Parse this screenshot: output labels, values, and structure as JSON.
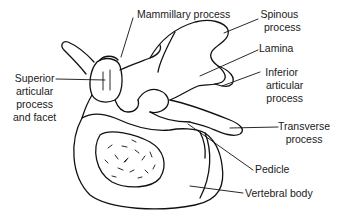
{
  "diagram": {
    "line_color": "#111111",
    "background": "#ffffff",
    "labels": [
      {
        "id": "mammillary",
        "text": "Mammillary process"
      },
      {
        "id": "spinous",
        "line1": "Spinous",
        "line2": "process"
      },
      {
        "id": "lamina",
        "text": "Lamina"
      },
      {
        "id": "inferior",
        "line1": "Inferior",
        "line2": "articular",
        "line3": "process"
      },
      {
        "id": "superior",
        "line1": "Superior",
        "line2": "articular",
        "line3": "process",
        "line4": "and facet"
      },
      {
        "id": "transverse",
        "line1": "Transverse",
        "line2": "process"
      },
      {
        "id": "pedicle",
        "text": "Pedicle"
      },
      {
        "id": "body",
        "text": "Vertebral body"
      }
    ]
  }
}
